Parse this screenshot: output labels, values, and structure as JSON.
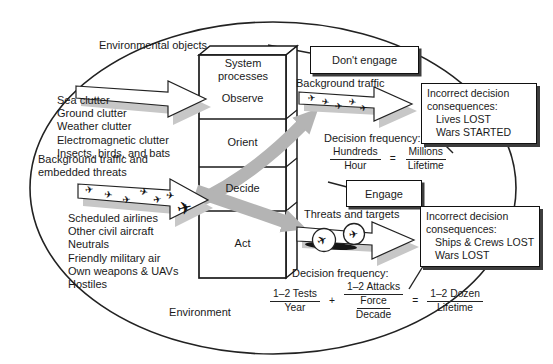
{
  "environment_label": "Environment",
  "column": {
    "header": "System processes",
    "stages": [
      "Observe",
      "Orient",
      "Decide",
      "Act"
    ]
  },
  "left": {
    "env_objects_label": "Environmental objects",
    "clutter": [
      "Sea clutter",
      "Ground clutter",
      "Weather clutter",
      "Electromagnetic clutter",
      "Insects, birds, and bats"
    ],
    "traffic_label": "Background traffic and embedded threats",
    "aircraft_types": [
      "Scheduled airlines",
      "Other civil aircraft",
      "Neutrals",
      "Friendly military air",
      "Own weapons & UAVs",
      "Hostiles"
    ]
  },
  "dont_engage": {
    "box_label": "Don't engage",
    "arrow_label": "Background traffic",
    "consequences_heading": "Incorrect decision consequences:",
    "consequence_1": "Lives LOST",
    "consequence_2": "Wars STARTED",
    "frequency_label": "Decision frequency:",
    "freq_num": "Hundreds",
    "freq_den": "Hour",
    "equals": "=",
    "result_num": "Millions",
    "result_den": "Lifetime"
  },
  "engage": {
    "box_label": "Engage",
    "arrow_label": "Threats and targets",
    "consequences_heading": "Incorrect decision consequences:",
    "consequence_1": "Ships & Crews LOST",
    "consequence_2": "Wars LOST",
    "frequency_label": "Decision frequency:",
    "term1_num": "1–2 Tests",
    "term1_den": "Year",
    "plus": "+",
    "term2_num": "1–2 Attacks",
    "term2_den_num": "Force",
    "term2_den_den": "Decade",
    "equals": "=",
    "result_num": "1–2 Dozen",
    "result_den": "Lifetime"
  },
  "icons": {
    "aircraft": "✈"
  },
  "colors": {
    "flow_arrow_gray": "#b4b4b4",
    "shadow_gray": "#c7c7c7",
    "ink": "#1a1a1a"
  }
}
